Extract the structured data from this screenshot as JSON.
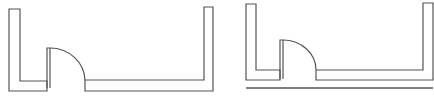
{
  "figure": {
    "panels": [
      {
        "id": "left",
        "has_baseline": false
      },
      {
        "id": "right",
        "has_baseline": true
      }
    ],
    "colors": {
      "line": "#555555",
      "background": "#ffffff"
    }
  }
}
